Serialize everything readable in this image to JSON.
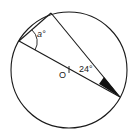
{
  "diagram": {
    "type": "circle-geometry",
    "circle": {
      "center": [
        69,
        70
      ],
      "radius": 58,
      "center_label": "O"
    },
    "points": {
      "A": [
        51,
        13
      ],
      "B": [
        19,
        41
      ],
      "C": [
        120,
        97
      ]
    },
    "segments": [
      {
        "from": "A",
        "to": "B",
        "name": "chord-AB"
      },
      {
        "from": "A",
        "to": "C",
        "name": "chord-AC"
      },
      {
        "from": "B",
        "to": "C",
        "name": "diameter-BC"
      }
    ],
    "labels": {
      "angle_a": "a°",
      "angle_24": "24°",
      "center": "O"
    },
    "colors": {
      "stroke": "#1a1a1a",
      "fill_angle": "#111111",
      "background": "#ffffff"
    }
  }
}
